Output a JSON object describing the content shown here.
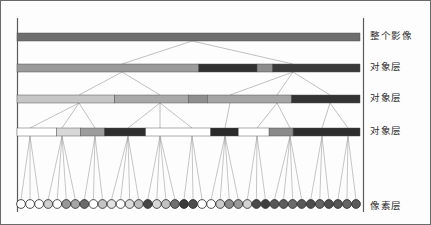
{
  "figure": {
    "background": "#fdfdfd",
    "border_color": "#555555",
    "link_color": "#8d8d8d",
    "axis_x": 363,
    "levels": [
      {
        "id": "whole-image",
        "label": "整个影像",
        "y": 33,
        "label_y": 28
      },
      {
        "id": "object-layer-1",
        "label": "对象层",
        "y": 64,
        "label_y": 59
      },
      {
        "id": "object-layer-2",
        "label": "对象层",
        "y": 95,
        "label_y": 90
      },
      {
        "id": "object-layer-3",
        "label": "对象层",
        "y": 128,
        "label_y": 123
      },
      {
        "id": "pixel-layer",
        "label": "像素层",
        "y": 204,
        "label_y": 198
      }
    ],
    "label_x": 370,
    "bar": {
      "x0": 17,
      "x1": 360,
      "height": 8
    }
  },
  "chart_data": {
    "type": "diagram",
    "level_labels": [
      "整个影像",
      "对象层",
      "对象层",
      "对象层",
      "像素层"
    ],
    "rows": [
      {
        "name": "whole-image-row",
        "segments": [
          {
            "start": 0.0,
            "end": 1.0,
            "color": "#6e6e6e"
          }
        ]
      },
      {
        "name": "object-row-1",
        "segments": [
          {
            "start": 0.0,
            "end": 0.53,
            "color": "#9a9a9a"
          },
          {
            "start": 0.53,
            "end": 0.7,
            "color": "#313131"
          },
          {
            "start": 0.7,
            "end": 0.745,
            "color": "#8c8c8c"
          },
          {
            "start": 0.745,
            "end": 1.0,
            "color": "#3a3a3a"
          }
        ]
      },
      {
        "name": "object-row-2",
        "segments": [
          {
            "start": 0.0,
            "end": 0.285,
            "color": "#c6c6c6"
          },
          {
            "start": 0.285,
            "end": 0.5,
            "color": "#a8a8a8"
          },
          {
            "start": 0.5,
            "end": 0.555,
            "color": "#8f8f8f"
          },
          {
            "start": 0.555,
            "end": 0.8,
            "color": "#a4a4a4"
          },
          {
            "start": 0.8,
            "end": 1.0,
            "color": "#343434"
          }
        ]
      },
      {
        "name": "object-row-3",
        "segments": [
          {
            "start": 0.0,
            "end": 0.115,
            "color": "#ffffff"
          },
          {
            "start": 0.115,
            "end": 0.185,
            "color": "#d8d8d8"
          },
          {
            "start": 0.185,
            "end": 0.255,
            "color": "#9d9d9d"
          },
          {
            "start": 0.255,
            "end": 0.375,
            "color": "#2f2f2f"
          },
          {
            "start": 0.375,
            "end": 0.565,
            "color": "#ffffff"
          },
          {
            "start": 0.565,
            "end": 0.645,
            "color": "#2b2b2b"
          },
          {
            "start": 0.645,
            "end": 0.735,
            "color": "#ffffff"
          },
          {
            "start": 0.735,
            "end": 0.805,
            "color": "#8a8a8a"
          },
          {
            "start": 0.805,
            "end": 1.0,
            "color": "#2d2d2d"
          }
        ]
      }
    ],
    "pixels": {
      "count": 38,
      "x_start": 21,
      "x_end": 356,
      "radius": 4.4,
      "colors": [
        "#ffffff",
        "#ffffff",
        "#ffffff",
        "#cfcfcf",
        "#ffffff",
        "#989898",
        "#a5a5a5",
        "#6a6a6a",
        "#ffffff",
        "#c4c4c4",
        "#e2e2e2",
        "#ffffff",
        "#dcdcdc",
        "#bdbdbd",
        "#474747",
        "#d6d6d6",
        "#c2c2c2",
        "#6f6f6f",
        "#3b3b3b",
        "#4e4e4e",
        "#ffffff",
        "#ffffff",
        "#c9c9c9",
        "#8b8b8b",
        "#9a9a9a",
        "#d3d3d3",
        "#4a4a4a",
        "#3f3f3f",
        "#565656",
        "#5c5c5c",
        "#6b6b6b",
        "#585858",
        "#4d4d4d",
        "#636363",
        "#4f4f4f",
        "#575757",
        "#666666",
        "#5a5a5a"
      ]
    },
    "tree_links": {
      "root_x": 192,
      "level1_parents": [
        122,
        293
      ],
      "level2_parents": [
        79,
        160,
        230,
        277,
        330
      ],
      "level3_parents": [
        30,
        62,
        95,
        128,
        160,
        192,
        225,
        257,
        290,
        322,
        348
      ],
      "description": "Tree edges connect each level's node centers downward to child node centers; bottom level fans out to pixel circles."
    }
  }
}
